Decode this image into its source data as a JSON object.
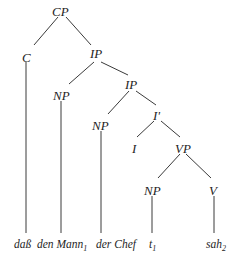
{
  "diagram": {
    "type": "syntax-tree",
    "nodes": {
      "cp": {
        "label": "CP",
        "x": 63,
        "y": 12
      },
      "c": {
        "label": "C",
        "x": 30,
        "y": 57
      },
      "ip1": {
        "label": "IP",
        "x": 98,
        "y": 57
      },
      "np1": {
        "label": "NP",
        "x": 63,
        "y": 95
      },
      "ip2": {
        "label": "IP",
        "x": 133,
        "y": 85
      },
      "np2": {
        "label": "NP",
        "x": 103,
        "y": 125
      },
      "ibar": {
        "label": "I'",
        "x": 158,
        "y": 115
      },
      "i": {
        "label": "I",
        "x": 135,
        "y": 148
      },
      "vp": {
        "label": "VP",
        "x": 183,
        "y": 148
      },
      "np3": {
        "label": "NP",
        "x": 153,
        "y": 190
      },
      "v": {
        "label": "V",
        "x": 213,
        "y": 190
      }
    },
    "leaves": {
      "dass": {
        "text": "daß",
        "sub": "",
        "x": 25,
        "y": 245
      },
      "den_mann": {
        "text": "den Mann",
        "sub": "1",
        "x": 62,
        "y": 245
      },
      "der_chef": {
        "text": "der Chef",
        "sub": "",
        "x": 101,
        "y": 245
      },
      "trace": {
        "text": "t",
        "sub": "1",
        "x": 152,
        "y": 245
      },
      "sah": {
        "text": "sah",
        "sub": "2",
        "x": 214,
        "y": 245
      }
    },
    "edges": [
      [
        "cp",
        "c"
      ],
      [
        "cp",
        "ip1"
      ],
      [
        "ip1",
        "np1"
      ],
      [
        "ip1",
        "ip2"
      ],
      [
        "ip2",
        "np2"
      ],
      [
        "ip2",
        "ibar"
      ],
      [
        "ibar",
        "i"
      ],
      [
        "ibar",
        "vp"
      ],
      [
        "vp",
        "np3"
      ],
      [
        "vp",
        "v"
      ]
    ],
    "leaf_edges": [
      [
        "c",
        "dass"
      ],
      [
        "np1",
        "den_mann"
      ],
      [
        "np2",
        "der_chef"
      ],
      [
        "np3",
        "trace"
      ],
      [
        "v",
        "sah"
      ]
    ]
  }
}
